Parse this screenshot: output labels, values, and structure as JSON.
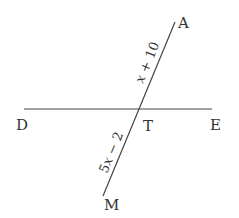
{
  "diagram": {
    "type": "intersecting-lines",
    "line_color": "#444444",
    "text_color": "#333333",
    "points": {
      "A": {
        "label": "A"
      },
      "D": {
        "label": "D"
      },
      "T": {
        "label": "T"
      },
      "E": {
        "label": "E"
      },
      "M": {
        "label": "M"
      }
    },
    "segments": {
      "AT": {
        "expr_var": "x",
        "expr_rest": " + 10"
      },
      "TM": {
        "expr_coef": "5",
        "expr_var": "x",
        "expr_rest": " − 2"
      }
    }
  }
}
